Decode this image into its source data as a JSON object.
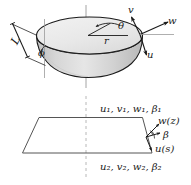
{
  "figure": {
    "name": "truncated-cone-velocity-diagram",
    "background_color": "#ffffff",
    "stroke_color": "#1a1a1a",
    "fill_light": "#efefef",
    "fill_mid": "#d8d8d8",
    "fill_dark": "#bdbdbd",
    "axis_color": "#999999"
  },
  "top_view": {
    "labels": {
      "slant_length": "L",
      "cone_angle": "ϕ",
      "radius": "r",
      "azimuth": "θ",
      "velocity_v": "v",
      "velocity_w": "w",
      "velocity_u": "u"
    }
  },
  "bottom_view": {
    "labels": {
      "top_boundary": "u₁, v₁, w₁, β₁",
      "top_boundary_parts": [
        "u",
        "1",
        "v",
        "1",
        "w",
        "1",
        "β",
        "1"
      ],
      "bottom_boundary": "u₂, v₂, w₂, β₂",
      "bottom_boundary_parts": [
        "u",
        "2",
        "v",
        "2",
        "w",
        "2",
        "β",
        "2"
      ],
      "w_of_z": "w(z)",
      "beta": "β",
      "u_of_s": "u(s)"
    }
  }
}
